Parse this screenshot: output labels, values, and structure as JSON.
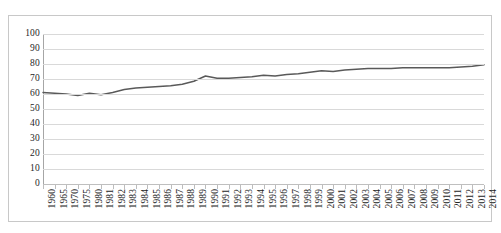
{
  "chart_data": {
    "type": "line",
    "title": "",
    "subtitle": "",
    "xlabel": "",
    "ylabel": "",
    "ylim": [
      0,
      100
    ],
    "yticks": [
      0,
      10,
      20,
      30,
      40,
      50,
      60,
      70,
      80,
      90,
      100
    ],
    "grid": true,
    "legend": false,
    "legend_position": "none",
    "series_color": "#595959",
    "grid_color": "#d9d9d9",
    "axis_color": "#a6a6a6",
    "categories": [
      "1960",
      "1965",
      "1970",
      "1975",
      "1980",
      "1981",
      "1982",
      "1983",
      "1984",
      "1985",
      "1986",
      "1987",
      "1988",
      "1989",
      "1990",
      "1991",
      "1992",
      "1993",
      "1994",
      "1995",
      "1996",
      "1997",
      "1998",
      "1999",
      "2000",
      "2001",
      "2002",
      "2003",
      "2004",
      "2005",
      "2006",
      "2007",
      "2008",
      "2009",
      "2010",
      "2011",
      "2012",
      "2013",
      "2014"
    ],
    "series": [
      {
        "name": "series-1",
        "values": [
          61,
          60.5,
          60,
          59,
          60.5,
          59.5,
          61,
          63,
          64,
          64.5,
          65,
          65.5,
          66.5,
          68.5,
          72,
          70.5,
          70.5,
          71,
          71.5,
          72.5,
          72,
          73,
          73.5,
          74.5,
          75.5,
          75,
          76,
          76.5,
          77,
          77,
          77,
          77.5,
          77.5,
          77.5,
          77.5,
          77.5,
          78,
          78.5,
          79.5
        ]
      }
    ]
  },
  "frame": {
    "border_color": "#c8c8c8"
  }
}
